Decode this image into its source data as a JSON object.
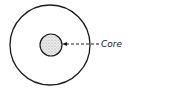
{
  "diagram": {
    "labels": {
      "core": "Core"
    },
    "shapes": {
      "outer_circle": {
        "cx": 50,
        "cy": 45,
        "r": 40
      },
      "core_circle": {
        "cx": 51,
        "cy": 45,
        "r": 11
      },
      "arrow": {
        "from_x": 99,
        "to_x": 63,
        "y": 44
      }
    },
    "colors": {
      "stroke": "#1a1a1a",
      "core_fill": "#d9d9d9"
    }
  }
}
